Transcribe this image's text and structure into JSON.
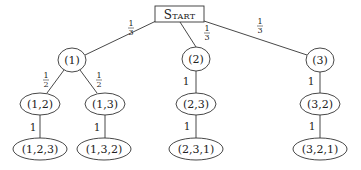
{
  "diagram": {
    "type": "probability-tree",
    "root": {
      "label": "Start"
    },
    "nodes": {
      "n1": {
        "label": "(1)"
      },
      "n2": {
        "label": "(2)"
      },
      "n3": {
        "label": "(3)"
      },
      "n12": {
        "label": "(1,2)"
      },
      "n13": {
        "label": "(1,3)"
      },
      "n23": {
        "label": "(2,3)"
      },
      "n32": {
        "label": "(3,2)"
      },
      "n123": {
        "label": "(1,2,3)"
      },
      "n132": {
        "label": "(1,3,2)"
      },
      "n231": {
        "label": "(2,3,1)"
      },
      "n321": {
        "label": "(3,2,1)"
      }
    },
    "edges": {
      "start_n1": {
        "num": "1",
        "den": "3"
      },
      "start_n2": {
        "num": "1",
        "den": "3"
      },
      "start_n3": {
        "num": "1",
        "den": "3"
      },
      "n1_n12": {
        "num": "1",
        "den": "2"
      },
      "n1_n13": {
        "num": "1",
        "den": "2"
      },
      "n2_n23": {
        "weight": "1"
      },
      "n3_n32": {
        "weight": "1"
      },
      "n12_n123": {
        "weight": "1"
      },
      "n13_n132": {
        "weight": "1"
      },
      "n23_n231": {
        "weight": "1"
      },
      "n32_n321": {
        "weight": "1"
      }
    }
  }
}
